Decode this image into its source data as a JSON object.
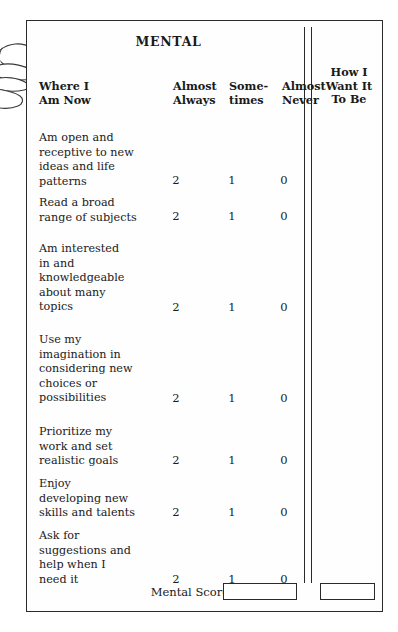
{
  "document": {
    "title": "MENTAL",
    "type": "self-assessment-worksheet"
  },
  "table": {
    "headers": {
      "where_i_am_now": "Where I\nAm Now",
      "almost_always": "Almost\nAlways",
      "sometimes": "Some-\ntimes",
      "almost_never": "Almost\nNever",
      "how_i_want_it_to_be": "How I\nWant It\nTo Be"
    },
    "rows": [
      {
        "statement": "Am open and\nreceptive to new\nideas and life\npatterns",
        "almost_always": "2",
        "sometimes": "1",
        "almost_never": "0"
      },
      {
        "statement": "Read a broad\nrange of subjects",
        "almost_always": "2",
        "sometimes": "1",
        "almost_never": "0"
      },
      {
        "statement": "Am interested\nin and\nknowledgeable\nabout many\ntopics",
        "almost_always": "2",
        "sometimes": "1",
        "almost_never": "0"
      },
      {
        "statement": "Use my\nimagination in\nconsidering new\nchoices or\npossibilities",
        "almost_always": "2",
        "sometimes": "1",
        "almost_never": "0"
      },
      {
        "statement": "Prioritize my\nwork and set\nrealistic goals",
        "almost_always": "2",
        "sometimes": "1",
        "almost_never": "0"
      },
      {
        "statement": "Enjoy\ndeveloping new\nskills and talents",
        "almost_always": "2",
        "sometimes": "1",
        "almost_never": "0"
      },
      {
        "statement": "Ask for\nsuggestions and\nhelp when I\nneed it",
        "almost_always": "2",
        "sometimes": "1",
        "almost_never": "0"
      }
    ]
  },
  "footer": {
    "score_label": "Mental Score",
    "score_now_value": "",
    "score_want_value": ""
  },
  "decoration": {
    "hand_icon": "hand-holding-page-icon"
  },
  "colors": {
    "ink": "#1a1a1a",
    "rule": "#2a2a2a",
    "paper": "#fefefe",
    "background": "#ffffff"
  },
  "layout": {
    "row_text_tops": [
      68,
      134,
      181,
      244,
      310,
      372,
      424
    ],
    "row_score_tops": [
      120,
      154,
      214,
      280,
      334,
      386,
      444
    ],
    "row_count": 7
  }
}
